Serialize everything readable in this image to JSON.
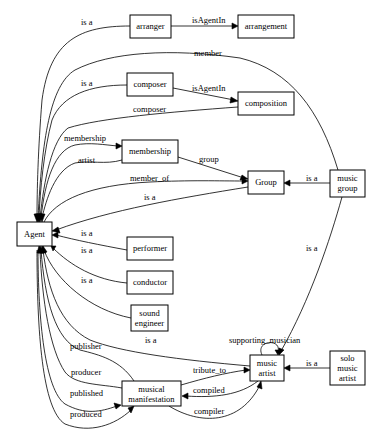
{
  "diagram": {
    "type": "ontology graph",
    "nodes": [
      {
        "id": "arranger",
        "lines": [
          "arranger"
        ]
      },
      {
        "id": "arrangement",
        "lines": [
          "arrangement"
        ]
      },
      {
        "id": "composer",
        "lines": [
          "composer"
        ]
      },
      {
        "id": "composition",
        "lines": [
          "composition"
        ]
      },
      {
        "id": "membership",
        "lines": [
          "membership"
        ]
      },
      {
        "id": "group",
        "lines": [
          "Group"
        ]
      },
      {
        "id": "music_group",
        "lines": [
          "music",
          "group"
        ]
      },
      {
        "id": "agent",
        "lines": [
          "Agent"
        ]
      },
      {
        "id": "performer",
        "lines": [
          "performer"
        ]
      },
      {
        "id": "conductor",
        "lines": [
          "conductor"
        ]
      },
      {
        "id": "sound_engineer",
        "lines": [
          "sound",
          "engineer"
        ]
      },
      {
        "id": "music_artist",
        "lines": [
          "music",
          "artist"
        ]
      },
      {
        "id": "solo_music_artist",
        "lines": [
          "solo",
          "music",
          "artist"
        ]
      },
      {
        "id": "musical_manifestation",
        "lines": [
          "musical",
          "manifestation"
        ]
      }
    ],
    "edges": [
      {
        "from": "arranger",
        "to": "agent",
        "label": "is a"
      },
      {
        "from": "arranger",
        "to": "arrangement",
        "label": "isAgentIn"
      },
      {
        "from": "music_group",
        "to": "agent",
        "label": "member"
      },
      {
        "from": "composer",
        "to": "agent",
        "label": "is a"
      },
      {
        "from": "composer",
        "to": "composition",
        "label": "isAgentIn"
      },
      {
        "from": "composition",
        "to": "agent",
        "label": "composer"
      },
      {
        "from": "agent",
        "to": "membership",
        "label": "membership"
      },
      {
        "from": "membership",
        "to": "agent",
        "label": "artist"
      },
      {
        "from": "membership",
        "to": "group",
        "label": "group"
      },
      {
        "from": "agent",
        "to": "group",
        "label": "member_of"
      },
      {
        "from": "group",
        "to": "agent",
        "label": "is a"
      },
      {
        "from": "music_group",
        "to": "group",
        "label": "is a"
      },
      {
        "from": "music_group",
        "to": "music_artist",
        "label": "is a"
      },
      {
        "from": "performer",
        "to": "agent",
        "label": "is a"
      },
      {
        "from": "conductor",
        "to": "agent",
        "label": "is a"
      },
      {
        "from": "sound_engineer",
        "to": "agent",
        "label": "is a"
      },
      {
        "from": "music_artist",
        "to": "agent",
        "label": "is a"
      },
      {
        "from": "music_artist",
        "to": "music_artist",
        "label": "supporting_musician"
      },
      {
        "from": "solo_music_artist",
        "to": "music_artist",
        "label": "is a"
      },
      {
        "from": "musical_manifestation",
        "to": "agent",
        "label": "publisher"
      },
      {
        "from": "musical_manifestation",
        "to": "agent",
        "label": "producer"
      },
      {
        "from": "agent",
        "to": "musical_manifestation",
        "label": "published"
      },
      {
        "from": "agent",
        "to": "musical_manifestation",
        "label": "produced"
      },
      {
        "from": "musical_manifestation",
        "to": "music_artist",
        "label": "tribute_to"
      },
      {
        "from": "music_artist",
        "to": "musical_manifestation",
        "label": "compiled"
      },
      {
        "from": "musical_manifestation",
        "to": "music_artist",
        "label": "compiler"
      }
    ]
  },
  "labels": {
    "arranger": "arranger",
    "arrangement": "arrangement",
    "composer": "composer",
    "composition": "composition",
    "membership": "membership",
    "group": "Group",
    "music_group_1": "music",
    "music_group_2": "group",
    "agent": "Agent",
    "performer": "performer",
    "conductor": "conductor",
    "sound_engineer_1": "sound",
    "sound_engineer_2": "engineer",
    "music_artist_1": "music",
    "music_artist_2": "artist",
    "solo_1": "solo",
    "solo_2": "music",
    "solo_3": "artist",
    "mm_1": "musical",
    "mm_2": "manifestation"
  },
  "edge_labels": {
    "arranger_isa": "is a",
    "arranger_isAgentIn": "isAgentIn",
    "member": "member",
    "composer_isa": "is a",
    "composer_isAgentIn": "isAgentIn",
    "composer_rel": "composer",
    "membership_rel": "membership",
    "artist": "artist",
    "group_rel": "group",
    "member_of": "member_of",
    "group_isa": "is a",
    "musicgroup_isa_group": "is a",
    "musicgroup_isa_artist": "is a",
    "performer_isa": "is a",
    "conductor_isa": "is a",
    "soundeng_isa": "is a",
    "musicartist_isa": "is a",
    "supporting_musician": "supporting_musician",
    "solo_isa": "is a",
    "publisher": "publisher",
    "producer": "producer",
    "published": "published",
    "produced": "produced",
    "tribute_to": "tribute_to",
    "compiled": "compiled",
    "compiler": "compiler"
  }
}
